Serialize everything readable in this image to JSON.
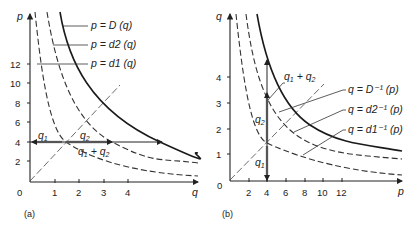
{
  "panels": [
    {
      "id": "a",
      "label": "(a)",
      "y_axis_label": "p",
      "x_axis_label": "q",
      "origin_label": "0",
      "x_ticks": [
        "1",
        "2",
        "3",
        "4"
      ],
      "y_ticks": [
        "2",
        "4",
        "6",
        "8",
        "10",
        "12"
      ],
      "curves": [
        {
          "label": "p = D (q)",
          "style": "solid"
        },
        {
          "label": "p = d2 (q)",
          "style": "dashed"
        },
        {
          "label": "p = d1 (q)",
          "style": "dashed"
        }
      ],
      "annotations": {
        "q1": "q1",
        "q2": "q2",
        "sum": "q1 + q2"
      },
      "horizontal_line_at_p": 4
    },
    {
      "id": "b",
      "label": "(b)",
      "y_axis_label": "q",
      "x_axis_label": "p",
      "origin_label": "0",
      "x_ticks": [
        "2",
        "4",
        "6",
        "8",
        "10",
        "12"
      ],
      "y_ticks": [
        "1",
        "2",
        "3",
        "4"
      ],
      "curves": [
        {
          "label": "q = D⁻¹ (p)",
          "style": "solid"
        },
        {
          "label": "q = d2⁻¹ (p)",
          "style": "dashed"
        },
        {
          "label": "q = d1⁻¹ (p)",
          "style": "dashed"
        }
      ],
      "annotations": {
        "q1": "q1",
        "q2": "q2",
        "sum": "q1 + q2"
      },
      "vertical_line_at_p": 4
    }
  ]
}
